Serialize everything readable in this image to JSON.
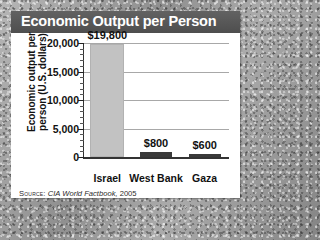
{
  "card": {
    "title": "Economic Output per Person"
  },
  "source": {
    "label": "Source:",
    "work": "CIA World Factbook,",
    "year": "2005"
  },
  "colors": {
    "title_band": "#4e4e4e",
    "title_text": "#ffffff",
    "card_background": "#ffffff",
    "page_background": "#a2a2a2",
    "tall_bar": "#c2c2c2",
    "short_bar": "#3a3a3a",
    "gridline": "#a8a8a8",
    "axis": "#333333"
  },
  "chart_data": {
    "type": "bar",
    "title": "Economic Output per Person",
    "xlabel": "",
    "ylabel": "Economic output per person (U.S. dollars)",
    "categories": [
      "Israel",
      "West Bank",
      "Gaza"
    ],
    "values": [
      19800,
      800,
      600
    ],
    "value_labels": [
      "$19,800",
      "$800",
      "$600"
    ],
    "ylim": [
      0,
      20000
    ],
    "yticks": [
      20000,
      15000,
      10000,
      5000,
      0
    ],
    "ytick_labels": [
      "20,000",
      "15,000",
      "10,000",
      "5,000",
      "0"
    ],
    "minor_tick_step": 1000,
    "grid": true,
    "legend": "none",
    "source": "SOURCE: CIA World Factbook, 2005"
  }
}
